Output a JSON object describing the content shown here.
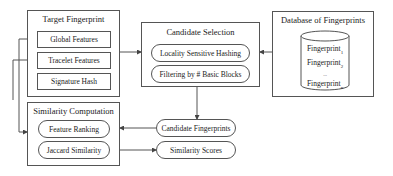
{
  "target": {
    "title": "Target Fingerprint",
    "items": [
      "Global Features",
      "Tracelet Features",
      "Signature Hash"
    ]
  },
  "candidate_selection": {
    "title": "Candidate Selection",
    "items": [
      "Locality Sensitive Hashing",
      "Filtering by # Basic Blocks"
    ]
  },
  "database": {
    "title": "Database of Fingerprints",
    "entries": [
      {
        "label": "Fingerprint",
        "sub": "1"
      },
      {
        "label": "Fingerprint",
        "sub": "2"
      },
      {
        "label": "...",
        "sub": ""
      },
      {
        "label": "Fingerprint",
        "sub": "n"
      }
    ]
  },
  "similarity": {
    "title": "Similarity Computation",
    "items": [
      "Feature Ranking",
      "Jaccard Similarity"
    ]
  },
  "outputs": {
    "candidate_fingerprints": "Candidate Fingerprints",
    "similarity_scores": "Similarity Scores"
  },
  "colors": {
    "stroke": "#555555",
    "text": "#222222",
    "background": "#ffffff"
  }
}
